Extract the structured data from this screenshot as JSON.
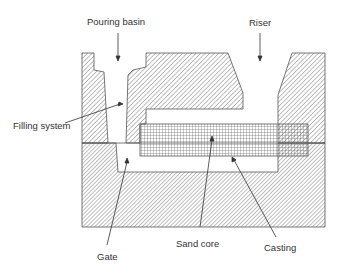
{
  "diagram": {
    "labels": {
      "pouring_basin": "Pouring basin",
      "riser": "Riser",
      "filling_system": "Filling system",
      "gate": "Gate",
      "sand_core": "Sand core",
      "casting": "Casting"
    },
    "colors": {
      "outline": "#555555",
      "hatch": "#6a6a6a",
      "text": "#333333",
      "background": "#ffffff"
    }
  }
}
